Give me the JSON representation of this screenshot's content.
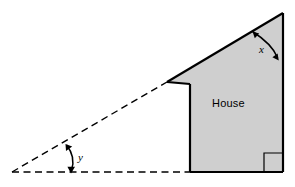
{
  "figure": {
    "kind": "geometry-diagram",
    "background_color": "#ffffff",
    "house": {
      "label": "House",
      "fill_color": "#cfcfcf",
      "stroke_color": "#000000",
      "right_angle_marker": true
    },
    "angles": [
      {
        "id": "x",
        "label": "x",
        "location": "roof apex, between sloped roof and vertical right wall",
        "style": "arc-with-arrowheads"
      },
      {
        "id": "y",
        "label": "y",
        "location": "left vertex, between dashed extension of roof line and dashed horizontal ground line",
        "style": "arc-with-arrowheads"
      }
    ],
    "lines": {
      "solid_stroke_color": "#000000",
      "dashed_stroke_color": "#000000",
      "dashed_pattern": "6 4"
    },
    "geometry": {
      "apex": [
        283,
        13
      ],
      "right_wall_bottom": [
        283,
        172
      ],
      "notch_corner": [
        167,
        82
      ],
      "ledge_right": [
        190,
        84
      ],
      "left_wall_bottom": [
        190,
        172
      ],
      "ground_left_vertex": [
        12,
        172
      ],
      "ground_right": [
        283,
        172
      ]
    }
  }
}
